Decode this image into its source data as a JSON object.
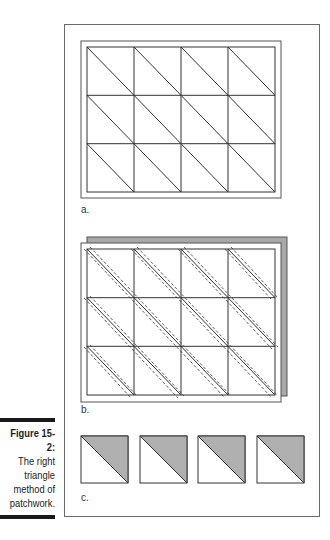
{
  "figure": {
    "number": "Figure 15-2:",
    "caption_lines": [
      "The right",
      "triangle",
      "method of",
      "patchwork."
    ],
    "panels": [
      {
        "label": "a.",
        "description": "4x3 grid of squares each divided by a diagonal"
      },
      {
        "label": "b.",
        "description": "grid layered over gray fabric with dashed seam lines along diagonals"
      },
      {
        "label": "c.",
        "description": "four half-square triangle units, upper-right half shaded gray"
      }
    ],
    "colors": {
      "line": "#333333",
      "shade": "#b0b0b0",
      "frame": "#6a6a6a",
      "caption_bar": "#1a1a1a"
    }
  }
}
